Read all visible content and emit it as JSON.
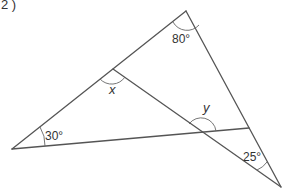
{
  "question": {
    "number_label": "2 )"
  },
  "figure": {
    "angles": {
      "top": "80°",
      "left": "30°",
      "bottom_right": "25°",
      "x_label": "x",
      "y_label": "y"
    },
    "vertices": {
      "top": [
        186,
        11
      ],
      "left": [
        12,
        149
      ],
      "bottom_right": [
        281,
        187
      ],
      "x_point": [
        113,
        69
      ],
      "right_inner": [
        249,
        128
      ],
      "y_point": [
        202,
        133
      ]
    },
    "colors": {
      "line": "#555555",
      "text": "#333333"
    }
  }
}
